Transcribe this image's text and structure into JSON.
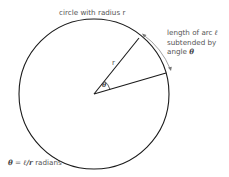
{
  "diagram": {
    "title_label": "circle with radius r",
    "radius_label": "r",
    "angle_label": "θ",
    "arc_label": {
      "line1_text": "length of arc ",
      "line1_symbol": "ℓ",
      "line2": "subtended by",
      "line3_text": "angle ",
      "line3_symbol": "θ"
    },
    "formula": {
      "theta": "θ",
      "equals": " = ",
      "ell_over_r": "ℓ/r",
      "unit": " radians"
    },
    "colors": {
      "stroke": "#1a1a1a",
      "text": "#555555",
      "arrow": "#777777",
      "background": "#ffffff"
    },
    "geometry": {
      "center": [
        94,
        94
      ],
      "radius": 75
    }
  }
}
